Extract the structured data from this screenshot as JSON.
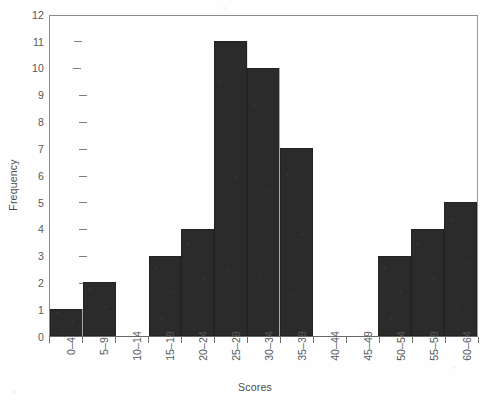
{
  "chart_data": {
    "type": "bar",
    "title": "",
    "xlabel": "Scores",
    "ylabel": "Frequency",
    "categories": [
      "0–4",
      "5–9",
      "10–14",
      "15–19",
      "20–24",
      "25–29",
      "30–34",
      "35–39",
      "40–44",
      "45–49",
      "50–54",
      "55–59",
      "60–64"
    ],
    "values": [
      1,
      2,
      0,
      3,
      4,
      11,
      10,
      7,
      0,
      0,
      3,
      4,
      5
    ],
    "ylim": [
      0,
      12
    ],
    "yticks": [
      0,
      1,
      2,
      3,
      4,
      5,
      6,
      7,
      8,
      9,
      10,
      11,
      12
    ],
    "ytick_labels": [
      "0",
      "1",
      "2",
      "3",
      "4",
      "5",
      "6",
      "7",
      "8",
      "9",
      "10",
      "11",
      "12"
    ],
    "grid": false,
    "legend": null,
    "legend_position": "none",
    "bar_color": "#2b2b2b",
    "background_color": "#ffffff",
    "axis_color": "#7d7d7d",
    "text_color": "#55585a",
    "xtick_rotation": 90,
    "ylabel_rotation": 90
  }
}
